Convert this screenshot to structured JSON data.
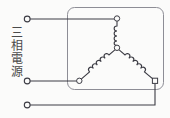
{
  "figure": {
    "kind": "electrical-schematic",
    "title": "",
    "background_color": "#fbfbfa",
    "line_color": "#3c3c44",
    "enclosure_color": "#8d8d95",
    "label_color": "#4a4a4a"
  },
  "source": {
    "label": "三相電源",
    "terminal_count": 3,
    "terminals": [
      {
        "name": "phase-1",
        "cx": 27,
        "cy": 19,
        "r": 3,
        "shape": "circle"
      },
      {
        "name": "phase-2",
        "cx": 27,
        "cy": 81,
        "r": 3,
        "shape": "circle"
      },
      {
        "name": "phase-3",
        "cx": 27,
        "cy": 105,
        "r": 3,
        "shape": "circle"
      }
    ]
  },
  "enclosure": {
    "name": "load-enclosure",
    "x": 67,
    "y": 7,
    "width": 97,
    "height": 83,
    "corner_radius": 7,
    "stroke": "#8d8d95",
    "stroke_width": 1
  },
  "load": {
    "connection": "wye",
    "neutral_node": {
      "cx": 117,
      "cy": 48,
      "r": 3,
      "shape": "circle"
    },
    "nodes": [
      {
        "name": "load-terminal-top",
        "cx": 117,
        "cy": 18,
        "r": 3,
        "shape": "circle"
      },
      {
        "name": "load-terminal-left",
        "cx": 79,
        "cy": 81,
        "r": 3,
        "shape": "circle"
      },
      {
        "name": "load-terminal-right",
        "cx": 155,
        "cy": 81,
        "r": 3,
        "shape": "square"
      }
    ],
    "coils": [
      {
        "name": "coil-phase-1",
        "loops": 4,
        "orientation": "vertical"
      },
      {
        "name": "coil-phase-2",
        "loops": 4,
        "orientation": "diagonal-left"
      },
      {
        "name": "coil-phase-3",
        "loops": 4,
        "orientation": "diagonal-right"
      }
    ]
  },
  "wires": [
    {
      "name": "wire-phase-1",
      "from": "phase-1",
      "to": "load-terminal-top",
      "path": "horizontal"
    },
    {
      "name": "wire-phase-2",
      "from": "phase-2",
      "to": "load-terminal-left",
      "path": "horizontal"
    },
    {
      "name": "wire-phase-3",
      "from": "phase-3",
      "to": "load-terminal-right",
      "path": "horizontal-then-vertical"
    }
  ]
}
